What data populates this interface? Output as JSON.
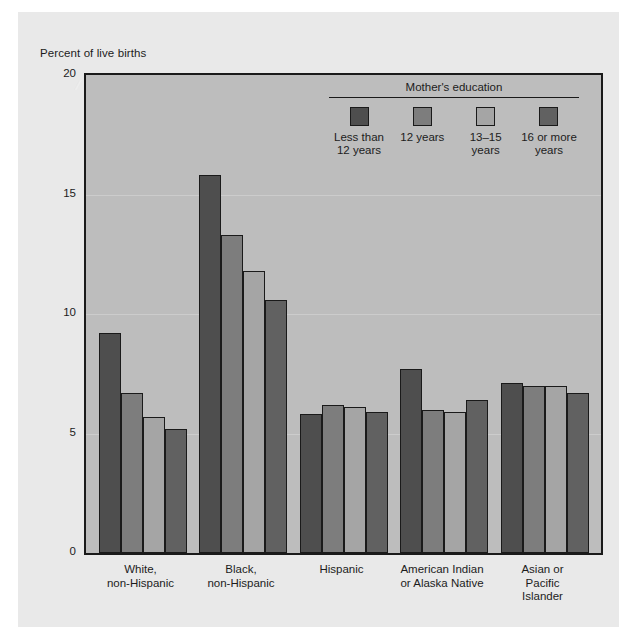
{
  "figure": {
    "axis_title": "Percent of live births",
    "background_color": "#e9e9e9",
    "plot_background_color": "#bdbdbd",
    "frame_color": "#1a1a1a"
  },
  "legend": {
    "title": "Mother's education",
    "items": [
      {
        "label": "Less than\n12 years",
        "color": "#4e4e4e"
      },
      {
        "label": "12 years",
        "color": "#7d7d7d"
      },
      {
        "label": "13–15 years",
        "color": "#a5a5a5"
      },
      {
        "label": "16 or more\nyears",
        "color": "#616161"
      }
    ]
  },
  "chart_data": {
    "type": "bar",
    "title": "",
    "xlabel": "",
    "ylabel": "Percent of live births",
    "ylim": [
      0,
      20
    ],
    "yticks": [
      0,
      5,
      10,
      15,
      20
    ],
    "ytick_labels": [
      "0",
      "5",
      "10",
      "15",
      "20"
    ],
    "grid": true,
    "legend_position": "top-right-inside",
    "categories": [
      "White,\nnon-Hispanic",
      "Black,\nnon-Hispanic",
      "Hispanic",
      "American Indian\nor Alaska Native",
      "Asian or Pacific\nIslander"
    ],
    "series": [
      {
        "name": "Less than 12 years",
        "color": "#4e4e4e",
        "values": [
          9.2,
          15.8,
          5.8,
          7.7,
          7.1
        ]
      },
      {
        "name": "12 years",
        "color": "#7d7d7d",
        "values": [
          6.7,
          13.3,
          6.2,
          6.0,
          7.0
        ]
      },
      {
        "name": "13-15 years",
        "color": "#a5a5a5",
        "values": [
          5.7,
          11.8,
          6.1,
          5.9,
          7.0
        ]
      },
      {
        "name": "16 or more years",
        "color": "#616161",
        "values": [
          5.2,
          10.6,
          5.9,
          6.4,
          6.7
        ]
      }
    ]
  }
}
